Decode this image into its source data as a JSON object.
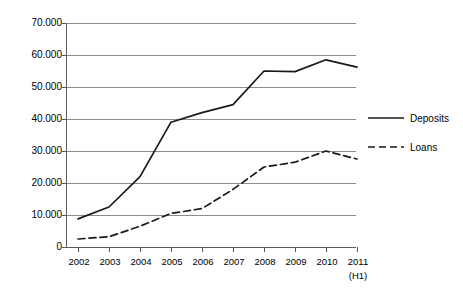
{
  "chart_data": {
    "type": "line",
    "title": "",
    "subtitle": "",
    "xlabel": "",
    "ylabel": "",
    "x": [
      "2002",
      "2003",
      "2004",
      "2005",
      "2006",
      "2007",
      "2008",
      "2009",
      "2010",
      "2011"
    ],
    "x_sublabels": [
      "",
      "",
      "",
      "",
      "",
      "",
      "",
      "",
      "",
      "(H1)"
    ],
    "categories": [
      "2002",
      "2003",
      "2004",
      "2005",
      "2006",
      "2007",
      "2008",
      "2009",
      "2010",
      "2011"
    ],
    "series": [
      {
        "name": "Deposits",
        "style": "solid",
        "color": "#1a1a1a",
        "values": [
          8800,
          12500,
          22000,
          39000,
          42000,
          44500,
          55000,
          54800,
          58500,
          56200
        ]
      },
      {
        "name": "Loans",
        "style": "dashed",
        "color": "#1a1a1a",
        "values": [
          2500,
          3200,
          6500,
          10500,
          12000,
          18000,
          25000,
          26500,
          30000,
          27500
        ]
      }
    ],
    "ylim": [
      0,
      70000
    ],
    "yticks": [
      0,
      10000,
      20000,
      30000,
      40000,
      50000,
      60000,
      70000
    ],
    "ytick_labels": [
      "0",
      "10.000",
      "20.000",
      "30.000",
      "40.000",
      "50.000",
      "60.000",
      "70.000"
    ],
    "grid": true,
    "grid_axis": "y",
    "legend_position": "right",
    "legend": [
      "Deposits",
      "Loans"
    ],
    "colors": {
      "line": "#1a1a1a",
      "grid": "#8c8c8c",
      "axis": "#5a5a5a",
      "background": "#ffffff"
    }
  }
}
